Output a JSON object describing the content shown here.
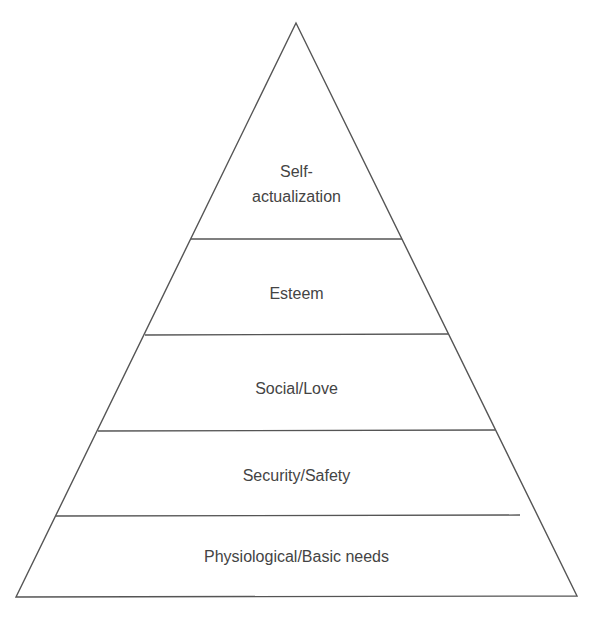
{
  "diagram": {
    "type": "pyramid",
    "levels": [
      {
        "label_line1": "Self-",
        "label_line2": "actualization"
      },
      {
        "label": "Esteem"
      },
      {
        "label": "Social/Love"
      },
      {
        "label": "Security/Safety"
      },
      {
        "label": "Physiological/Basic needs"
      }
    ],
    "stroke_color": "#555555",
    "text_color": "#444444"
  }
}
